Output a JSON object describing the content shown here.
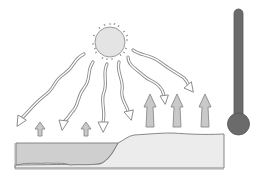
{
  "diagram": {
    "title": "",
    "colors": {
      "background": "#ffffff",
      "sun_fill": "#e4e4e4",
      "sun_rays": "#8a8a8a",
      "ray_arrow_fill": "#ffffff",
      "ray_arrow_stroke": "#8c8c8c",
      "heat_arrow_fill": "#c9c9c9",
      "heat_arrow_stroke": "#8a8a8a",
      "water_fill": "#cfcfcf",
      "land_fill": "#ececec",
      "outline": "#7a7a7a",
      "thermometer": "#6b6b6b"
    },
    "elements": {
      "sun": {
        "label": ""
      },
      "incoming_rays": {
        "count": 6
      },
      "water_heat_arrows": {
        "count": 2,
        "size": "small"
      },
      "land_heat_arrows": {
        "count": 3,
        "size": "large"
      },
      "water": {
        "label": ""
      },
      "land": {
        "label": ""
      },
      "thermometer": {
        "label": ""
      }
    }
  }
}
